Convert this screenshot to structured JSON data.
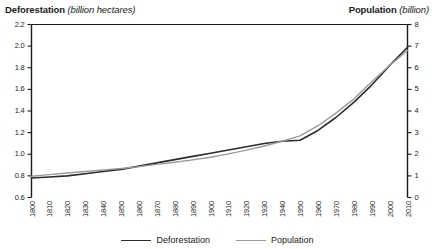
{
  "titles": {
    "left_name": "Deforestation",
    "left_unit": "(billion hectares)",
    "right_name": "Population",
    "right_unit": "(billion)"
  },
  "legend": {
    "items": [
      {
        "label": "Deforestation",
        "color": "#2b2b2b"
      },
      {
        "label": "Population",
        "color": "#9a9a9a"
      }
    ]
  },
  "chart_data": {
    "type": "line",
    "xlabel": "",
    "ylabel": "Deforestation (billion hectares)",
    "y2label": "Population (billion)",
    "grid": false,
    "legend_position": "bottom-center",
    "xlim": [
      1800,
      2010
    ],
    "ylim": [
      0.6,
      2.2
    ],
    "y2lim": [
      0,
      8
    ],
    "x_ticks": [
      1800,
      1810,
      1820,
      1830,
      1840,
      1850,
      1860,
      1870,
      1880,
      1890,
      1900,
      1910,
      1920,
      1930,
      1940,
      1950,
      1960,
      1970,
      1980,
      1990,
      2000,
      2010
    ],
    "y_ticks": [
      "0.6",
      "0.8",
      "1.0",
      "1.2",
      "1.4",
      "1.6",
      "1.8",
      "2.0",
      "2.2"
    ],
    "y2_ticks": [
      "0",
      "1",
      "2",
      "3",
      "4",
      "5",
      "6",
      "7",
      "8"
    ],
    "x": [
      1800,
      1810,
      1820,
      1830,
      1840,
      1850,
      1860,
      1870,
      1880,
      1890,
      1900,
      1910,
      1920,
      1930,
      1940,
      1950,
      1960,
      1970,
      1980,
      1990,
      2000,
      2010
    ],
    "series": [
      {
        "name": "Deforestation",
        "axis": "left",
        "color": "#2b2b2b",
        "unit": "billion hectares",
        "values": [
          0.78,
          0.79,
          0.8,
          0.82,
          0.84,
          0.86,
          0.89,
          0.92,
          0.95,
          0.98,
          1.01,
          1.04,
          1.07,
          1.1,
          1.12,
          1.13,
          1.22,
          1.34,
          1.48,
          1.64,
          1.82,
          1.99
        ]
      },
      {
        "name": "Population",
        "axis": "right",
        "color": "#9a9a9a",
        "unit": "billion",
        "values": [
          0.98,
          1.06,
          1.13,
          1.2,
          1.27,
          1.34,
          1.43,
          1.53,
          1.63,
          1.74,
          1.86,
          2.02,
          2.19,
          2.38,
          2.6,
          2.85,
          3.32,
          3.9,
          4.55,
          5.35,
          6.1,
          6.8
        ]
      }
    ],
    "annotations": [
      {
        "text": "Curves cross near 1995",
        "x": 1995
      }
    ]
  }
}
